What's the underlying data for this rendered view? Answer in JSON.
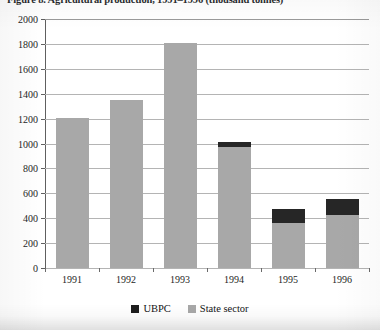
{
  "figure": {
    "caption": "Figure 8. Agricultural production, 1991–1996 (thousand tonnes)"
  },
  "chart_data": {
    "type": "bar",
    "stacked": true,
    "title": "Figure 8. Agricultural production, 1991–1996 (thousand tonnes)",
    "xlabel": "",
    "ylabel": "",
    "ylim": [
      0,
      2000
    ],
    "ytick_step": 200,
    "grid": "horizontal",
    "legend_position": "bottom",
    "categories": [
      "1991",
      "1992",
      "1993",
      "1994",
      "1995",
      "1996"
    ],
    "yticks": [
      "0",
      "200",
      "400",
      "600",
      "800",
      "1000",
      "1200",
      "1400",
      "1600",
      "1800",
      "2000"
    ],
    "series": [
      {
        "name": "UBPC",
        "color": "#262626",
        "values": [
          0,
          0,
          0,
          45,
          110,
          130
        ]
      },
      {
        "name": "State sector",
        "color": "#a8a8a8",
        "values": [
          1205,
          1350,
          1810,
          970,
          365,
          425
        ]
      }
    ],
    "totals": [
      1205,
      1350,
      1810,
      1015,
      475,
      555
    ]
  },
  "legend": {
    "items": [
      {
        "label": "UBPC",
        "color": "#262626"
      },
      {
        "label": "State sector",
        "color": "#a8a8a8"
      }
    ]
  }
}
